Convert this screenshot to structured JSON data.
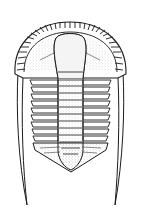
{
  "figure": {
    "parts": [
      "cephalon",
      "glabella",
      "genal-spines",
      "thorax-segments",
      "pygidium"
    ],
    "thorax_segment_count": 9,
    "colors": {
      "ink": "#1a1a1a",
      "background": "#ffffff",
      "stipple": "#8a8a8a"
    }
  }
}
